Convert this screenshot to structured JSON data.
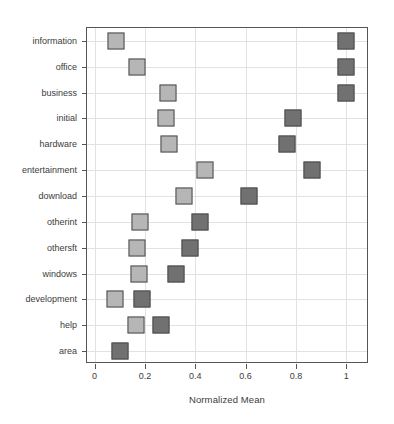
{
  "chart_data": {
    "type": "scatter",
    "title": "",
    "xlabel": "Normalized Mean",
    "ylabel": "",
    "xlim": [
      -0.03,
      1.09
    ],
    "xticks": [
      0,
      0.2,
      0.4,
      0.6,
      0.8,
      1
    ],
    "xtick_labels": [
      "0",
      "0.2",
      "0.4",
      "0.6",
      "0.8",
      "1"
    ],
    "grid": true,
    "legend": "none",
    "categories": [
      "information",
      "office",
      "business",
      "initial",
      "hardware",
      "entertainment",
      "download",
      "otherint",
      "othersft",
      "windows",
      "development",
      "help",
      "area"
    ],
    "series": [
      {
        "name": "light-series",
        "color": "#b6b6b6",
        "marker": "square",
        "values": [
          0.085,
          0.17,
          0.29,
          0.285,
          0.295,
          0.44,
          0.355,
          0.18,
          0.17,
          0.175,
          0.08,
          0.165,
          null
        ]
      },
      {
        "name": "dark-series",
        "color": "#717171",
        "marker": "square",
        "values": [
          1.0,
          1.0,
          1.0,
          0.79,
          0.765,
          0.865,
          0.615,
          0.42,
          0.38,
          0.325,
          0.19,
          0.265,
          0.1
        ]
      }
    ]
  },
  "colors": {
    "light_marker": "#b6b6b6",
    "dark_marker": "#717171",
    "marker_border": "#4d4d4d",
    "gridline": "#e2e2e2",
    "frame": "#555555",
    "text": "#3c3c3c",
    "background": "#ffffff"
  }
}
